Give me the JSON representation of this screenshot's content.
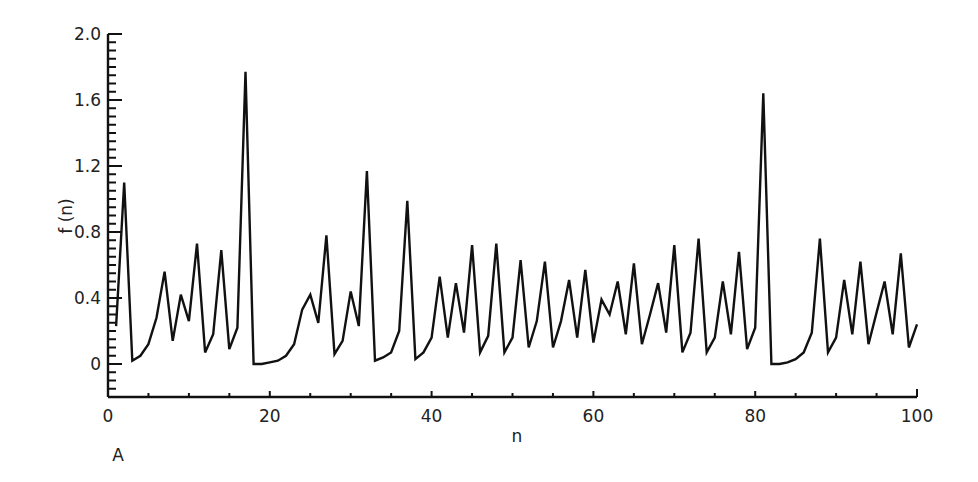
{
  "panel_label": "A",
  "chart_data": {
    "type": "line",
    "title": "",
    "xlabel": "n",
    "ylabel": "f (n)",
    "xlim": [
      0,
      100
    ],
    "ylim": [
      -0.2,
      2.0
    ],
    "grid": false,
    "legend": null,
    "x_ticks": [
      0,
      20,
      40,
      60,
      80,
      100
    ],
    "x_tick_labels": [
      "0",
      "20",
      "40",
      "60",
      "80",
      "100"
    ],
    "x_minor_step": 5,
    "y_ticks": [
      0,
      0.4,
      0.8,
      1.2,
      1.6,
      2.0
    ],
    "y_tick_labels": [
      "0",
      "0.4",
      "0.8",
      "1.2",
      "1.6",
      "2.0"
    ],
    "y_minor_step": 0.05,
    "series": [
      {
        "name": "f(n)",
        "color": "#111111",
        "x": [
          1,
          2,
          3,
          4,
          5,
          6,
          7,
          8,
          9,
          10,
          11,
          12,
          13,
          14,
          15,
          16,
          17,
          18,
          19,
          20,
          21,
          22,
          23,
          24,
          25,
          26,
          27,
          28,
          29,
          30,
          31,
          32,
          33,
          34,
          35,
          36,
          37,
          38,
          39,
          40,
          41,
          42,
          43,
          44,
          45,
          46,
          47,
          48,
          49,
          50,
          51,
          52,
          53,
          54,
          55,
          56,
          57,
          58,
          59,
          60,
          61,
          62,
          63,
          64,
          65,
          66,
          67,
          68,
          69,
          70,
          71,
          72,
          73,
          74,
          75,
          76,
          77,
          78,
          79,
          80,
          81,
          82,
          83,
          84,
          85,
          86,
          87,
          88,
          89,
          90,
          91,
          92,
          93,
          94,
          95,
          96,
          97,
          98,
          99,
          100
        ],
        "values": [
          0.23,
          1.1,
          0.02,
          0.05,
          0.12,
          0.28,
          0.56,
          0.14,
          0.42,
          0.26,
          0.73,
          0.07,
          0.18,
          0.69,
          0.09,
          0.22,
          1.77,
          0.0,
          0.0,
          0.01,
          0.02,
          0.05,
          0.12,
          0.33,
          0.42,
          0.25,
          0.78,
          0.06,
          0.14,
          0.44,
          0.23,
          1.17,
          0.02,
          0.04,
          0.07,
          0.2,
          0.99,
          0.03,
          0.07,
          0.16,
          0.53,
          0.16,
          0.49,
          0.19,
          0.72,
          0.07,
          0.17,
          0.73,
          0.07,
          0.16,
          0.63,
          0.1,
          0.26,
          0.62,
          0.1,
          0.26,
          0.51,
          0.16,
          0.57,
          0.13,
          0.39,
          0.3,
          0.5,
          0.18,
          0.61,
          0.12,
          0.3,
          0.49,
          0.19,
          0.72,
          0.07,
          0.19,
          0.76,
          0.07,
          0.16,
          0.5,
          0.18,
          0.68,
          0.09,
          0.22,
          1.64,
          0.0,
          0.0,
          0.01,
          0.03,
          0.07,
          0.19,
          0.76,
          0.07,
          0.16,
          0.51,
          0.18,
          0.62,
          0.12,
          0.31,
          0.5,
          0.18,
          0.67,
          0.1,
          0.24
        ]
      }
    ]
  }
}
